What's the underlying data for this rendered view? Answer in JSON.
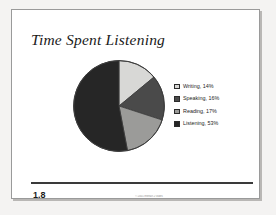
{
  "slide": {
    "title": "Time Spent Listening",
    "page_number": "1.8",
    "footer_note": "© 2001 Interact 2 Gates"
  },
  "colors": {
    "page_background": "#ffffff",
    "scan_background": "#f4f3f2",
    "page_border": "#9a9a9a",
    "title_text": "#1a1a1a",
    "rule": "#3a3a3a",
    "slice_writing": "#d8d8d6",
    "slice_speaking": "#4a4a4a",
    "slice_reading": "#9b9b99",
    "slice_listening": "#262626",
    "slice_outline": "#3c3c3c"
  },
  "chart_data": {
    "type": "pie",
    "title": "Time Spent Listening",
    "categories": [
      "Writing",
      "Speaking",
      "Reading",
      "Listening"
    ],
    "values": [
      14,
      16,
      17,
      53
    ],
    "value_unit": "%",
    "start_angle": 0,
    "direction": "clockwise",
    "legend_position": "right",
    "grid": false,
    "legend_entries": [
      {
        "label": "Writing, 14%",
        "name": "Writing",
        "value": 14,
        "color": "#d8d8d6"
      },
      {
        "label": "Speaking, 16%",
        "name": "Speaking",
        "value": 16,
        "color": "#4a4a4a"
      },
      {
        "label": "Reading, 17%",
        "name": "Reading",
        "value": 17,
        "color": "#9b9b99"
      },
      {
        "label": "Listening, 53%",
        "name": "Listening",
        "value": 53,
        "color": "#262626"
      }
    ]
  }
}
